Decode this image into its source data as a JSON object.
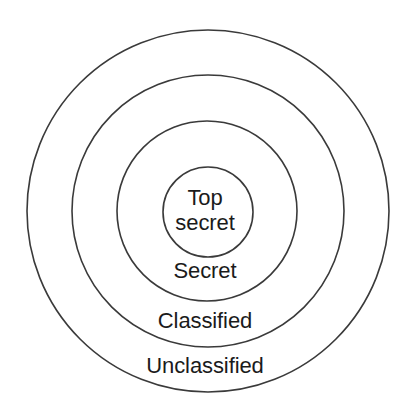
{
  "diagram": {
    "type": "concentric-circles",
    "title": "",
    "background_color": "#ffffff",
    "stroke_color": "#3a3a3a",
    "text_color": "#1b1b1b",
    "center": {
      "x": 208,
      "y": 211
    },
    "rings": [
      {
        "name": "unclassified",
        "label": "Unclassified",
        "level": 1,
        "diameter": 363,
        "radius": 181.5,
        "label_position": {
          "x": 205,
          "y": 365
        }
      },
      {
        "name": "classified",
        "label": "Classified",
        "level": 2,
        "diameter": 272,
        "radius": 136,
        "label_position": {
          "x": 205,
          "y": 320
        }
      },
      {
        "name": "secret",
        "label": "Secret",
        "level": 3,
        "diameter": 180,
        "radius": 90,
        "label_position": {
          "x": 205,
          "y": 270
        }
      },
      {
        "name": "top-secret",
        "label": "Top secret",
        "label_line1": "Top",
        "label_line2": "secret",
        "level": 4,
        "diameter": 90,
        "radius": 45,
        "label_position": {
          "x": 208,
          "y": 209
        }
      }
    ]
  }
}
